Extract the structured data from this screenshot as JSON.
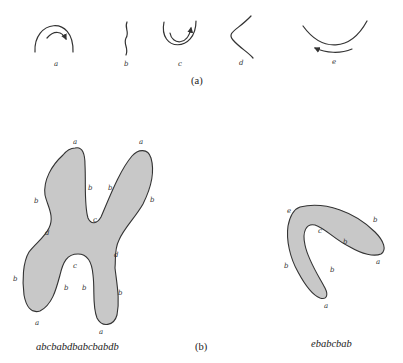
{
  "part_a": {
    "label": "(a)",
    "primitives": [
      {
        "name": "a",
        "description": "convex arc with clockwise arrow"
      },
      {
        "name": "b",
        "description": "straight (wavy) vertical segment"
      },
      {
        "name": "c",
        "description": "concave arc with counterclockwise arrow"
      },
      {
        "name": "d",
        "description": "inflection curve"
      },
      {
        "name": "e",
        "description": "wide shallow concave arc with leftward arrow"
      }
    ]
  },
  "part_b": {
    "label": "(b)",
    "shapes": [
      {
        "name": "chromosome-x",
        "string": "abcbabdbabcbabdb",
        "boundary_labels": {
          "top_left_a": "a",
          "top_right_a": "a",
          "left_upper_b": "b",
          "inner_upper_left_b": "b",
          "inner_upper_right_b": "b",
          "right_upper_b": "b",
          "upper_c": "c",
          "left_d": "d",
          "right_d": "d",
          "lower_c": "c",
          "left_lower_b": "b",
          "inner_lower_left_b": "b",
          "inner_lower_right_b": "b",
          "right_lower_b": "b",
          "bottom_left_a": "a",
          "bottom_right_a": "a"
        }
      },
      {
        "name": "chromosome-bent",
        "string": "ebabcbab",
        "boundary_labels": {
          "top_e": "e",
          "right_outer_b": "b",
          "right_end_a": "a",
          "inner_b_right": "b",
          "inner_c": "c",
          "inner_b_lower": "b",
          "bottom_a": "a",
          "left_outer_b": "b"
        }
      }
    ]
  }
}
